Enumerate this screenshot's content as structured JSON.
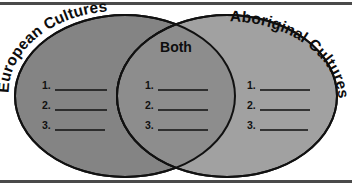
{
  "worksheet": {
    "type": "venn-diagram",
    "background_color": "#ffffff",
    "rule_color": "#4a4a4a"
  },
  "left_circle": {
    "label": "European Cultures",
    "fill_color": "#848484",
    "stroke_color": "#111111",
    "items": [
      "1.",
      "2.",
      "3."
    ]
  },
  "center_overlap": {
    "label": "Both",
    "fill_color": "#8d8d8d",
    "items": [
      "1.",
      "2.",
      "3."
    ]
  },
  "right_circle": {
    "label": "Aboriginal Cultures",
    "fill_color": "#9e9e9e",
    "stroke_color": "#111111",
    "items": [
      "1.",
      "2.",
      "3."
    ]
  }
}
